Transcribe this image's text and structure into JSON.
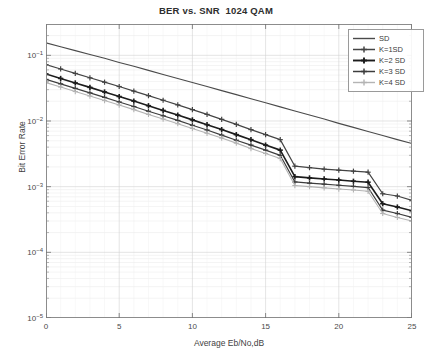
{
  "chart_data": {
    "type": "line",
    "title": "BER vs. SNR  1024 QAM",
    "xlabel": "Average Eb/No,dB",
    "ylabel": "Bit Error Rate",
    "xlim": [
      0,
      25
    ],
    "ylim": [
      1e-05,
      0.3
    ],
    "yscale": "log",
    "grid": true,
    "xticks": [
      0,
      5,
      10,
      15,
      20,
      25
    ],
    "xtick_labels": [
      "0",
      "5",
      "10",
      "15",
      "20",
      "25"
    ],
    "yticks": [
      0.1,
      0.01,
      0.001,
      0.0001,
      1e-05
    ],
    "ytick_labels": [
      "10-1",
      "10-2",
      "10-3",
      "10-4",
      "10-5"
    ],
    "legend_position": "upper right",
    "x": [
      0,
      1,
      2,
      3,
      4,
      5,
      6,
      7,
      8,
      9,
      10,
      11,
      12,
      13,
      14,
      15,
      16,
      17,
      18,
      19,
      20,
      21,
      22,
      23,
      24,
      25
    ],
    "series": [
      {
        "name": "SD",
        "color": "#4a4a4a",
        "marker": "none",
        "width": 1.1,
        "values": [
          0.155,
          0.135,
          0.118,
          0.103,
          0.09,
          0.078,
          0.068,
          0.059,
          0.051,
          0.0445,
          0.0385,
          0.0335,
          0.029,
          0.0252,
          0.0218,
          0.019,
          0.0164,
          0.0142,
          0.0123,
          0.0107,
          0.0092,
          0.008,
          0.0069,
          0.006,
          0.0052,
          0.00455
        ]
      },
      {
        "name": "K=1SD",
        "color": "#444444",
        "marker": "plus",
        "width": 1.2,
        "values": [
          0.072,
          0.062,
          0.053,
          0.0455,
          0.039,
          0.0335,
          0.0285,
          0.0243,
          0.0207,
          0.0176,
          0.0149,
          0.0126,
          0.0106,
          0.0089,
          0.0074,
          0.0062,
          0.0052,
          0.00205,
          0.00195,
          0.00185,
          0.00178,
          0.00172,
          0.00166,
          0.00078,
          0.00072,
          0.00062
        ]
      },
      {
        "name": "K=2 SD",
        "color": "#1c1c1c",
        "marker": "plus",
        "width": 1.6,
        "values": [
          0.052,
          0.0445,
          0.038,
          0.0325,
          0.0277,
          0.0236,
          0.0201,
          0.0171,
          0.0145,
          0.0123,
          0.0104,
          0.0088,
          0.0074,
          0.0062,
          0.0052,
          0.0043,
          0.0036,
          0.00142,
          0.00136,
          0.00131,
          0.00126,
          0.00121,
          0.00117,
          0.00055,
          0.00049,
          0.00043
        ]
      },
      {
        "name": "K=3 SD",
        "color": "#3d3d3d",
        "marker": "plus",
        "width": 1.2,
        "values": [
          0.043,
          0.0368,
          0.0314,
          0.0268,
          0.0229,
          0.0195,
          0.0166,
          0.0141,
          0.012,
          0.0102,
          0.0086,
          0.0073,
          0.0061,
          0.0051,
          0.0043,
          0.0036,
          0.003,
          0.00118,
          0.00113,
          0.00109,
          0.00105,
          0.00101,
          0.00097,
          0.00044,
          0.00039,
          0.00034
        ]
      },
      {
        "name": "K=4 SD",
        "color": "#b4b4b4",
        "marker": "plus",
        "width": 1.1,
        "values": [
          0.0385,
          0.0329,
          0.0281,
          0.024,
          0.0205,
          0.0175,
          0.0149,
          0.0126,
          0.0107,
          0.0091,
          0.0077,
          0.0065,
          0.0055,
          0.0046,
          0.0038,
          0.0032,
          0.00268,
          0.00104,
          0.001,
          0.00096,
          0.00092,
          0.00089,
          0.00085,
          0.00039,
          0.00034,
          0.0003
        ]
      }
    ]
  },
  "legend": {
    "entries": [
      {
        "label": "SD"
      },
      {
        "label": "K=1SD"
      },
      {
        "label": "K=2 SD"
      },
      {
        "label": "K=3 SD"
      },
      {
        "label": "K=4 SD"
      }
    ]
  }
}
